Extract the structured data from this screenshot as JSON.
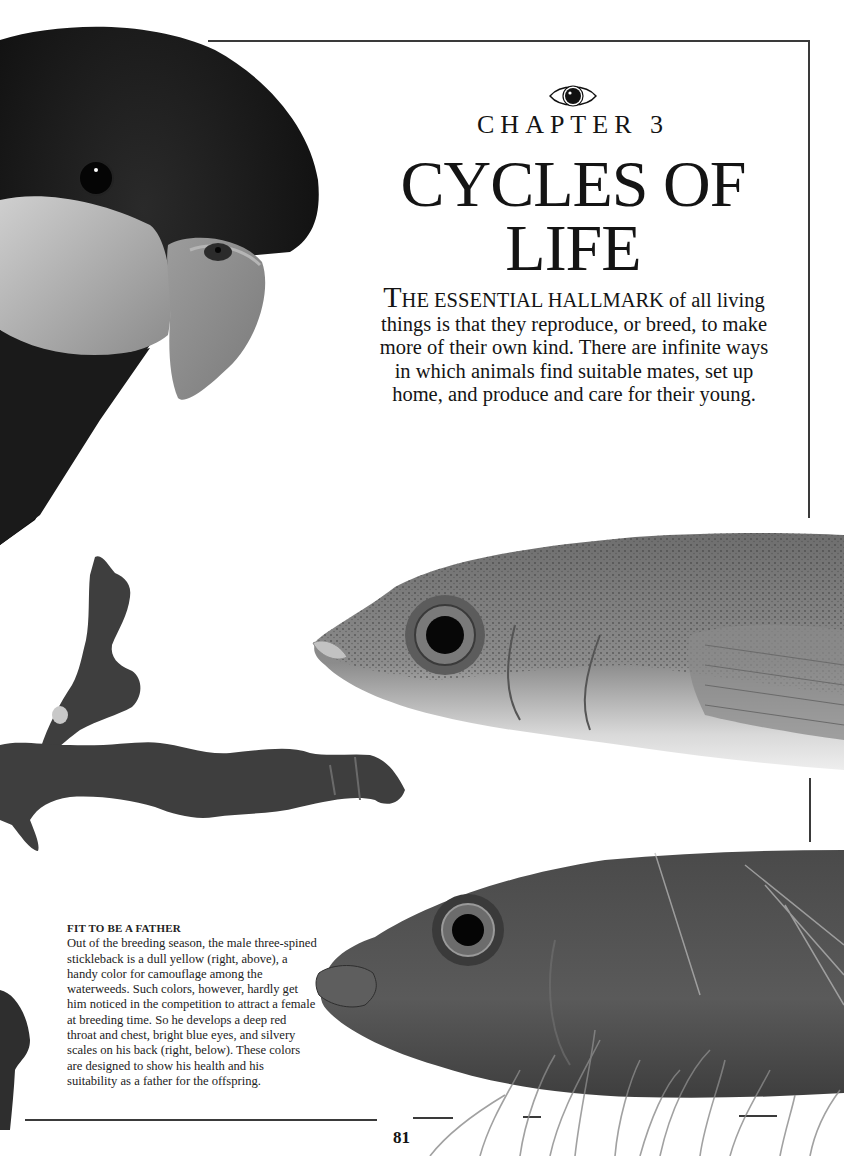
{
  "page": {
    "chapter_label": "CHAPTER 3",
    "chapter_title_line1": "CYCLES OF",
    "chapter_title_line2": "LIFE",
    "chapter_icon": "eye-icon",
    "intro": {
      "dropcap": "T",
      "smallcaps_lead": "HE ESSENTIAL HALLMARK",
      "body": " of all living things is that they reproduce, or breed, to make more of their own kind. There are infinite ways in which animals find suitable mates, set up home, and produce and care for their young."
    },
    "caption": {
      "title": "FIT TO BE A FATHER",
      "body": "Out of the breeding season, the male three-spined stickleback is a dull yellow (right, above), a handy color for camouflage among the waterweeds. Such colors, however, hardly get him noticed in the competition to attract a female at breeding time. So he develops a deep red throat and chest, bright blue eyes, and silvery scales on his back (right, below). These colors are designed to show his health and his suitability as a father for the offspring."
    },
    "page_number": "81"
  },
  "images": [
    {
      "name": "parrot-head-photo",
      "subject": "dark parrot with pale cheek and curved beak"
    },
    {
      "name": "twig-photo",
      "subject": "bare branch"
    },
    {
      "name": "stickleback-dull-photo",
      "subject": "male stickleback, non-breeding colors (right, above)"
    },
    {
      "name": "stickleback-breeding-photo",
      "subject": "male stickleback, breeding colors (right, below)"
    }
  ]
}
